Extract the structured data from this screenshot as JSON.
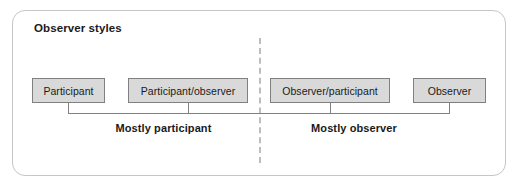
{
  "panel": {
    "title": "Observer styles"
  },
  "divider": {
    "style": "dashed",
    "color": "#bdbdbd"
  },
  "boxes": [
    {
      "label": "Participant"
    },
    {
      "label": "Participant/observer"
    },
    {
      "label": "Observer/participant"
    },
    {
      "label": "Observer"
    }
  ],
  "brackets": [
    {
      "caption": "Mostly participant"
    },
    {
      "caption": "Mostly observer"
    }
  ],
  "colors": {
    "box_fill": "#d9d9d9",
    "box_border": "#808080",
    "panel_border": "#c6c6c6",
    "text": "#1a1a1a",
    "background": "#ffffff"
  }
}
